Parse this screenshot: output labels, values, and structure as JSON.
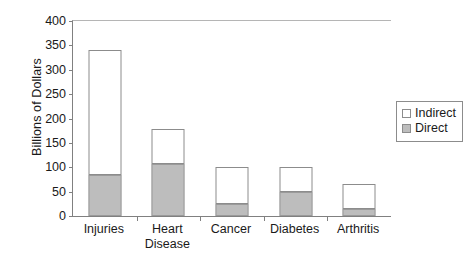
{
  "chart_data": {
    "type": "bar",
    "subtype": "stacked-vertical",
    "title": "",
    "xlabel": "",
    "ylabel": "Billions of Dollars",
    "ylim": [
      0,
      400
    ],
    "yticks": [
      0,
      50,
      100,
      150,
      200,
      250,
      300,
      350,
      400
    ],
    "ytick_labels": [
      "0",
      "50",
      "100",
      "150",
      "200",
      "250",
      "300",
      "350",
      "400"
    ],
    "grid": false,
    "legend_position": "right",
    "categories": [
      "Injuries",
      "Heart Disease",
      "Cancer",
      "Diabetes",
      "Arthritis"
    ],
    "category_label_lines": [
      [
        "Injuries"
      ],
      [
        "Heart",
        "Disease"
      ],
      [
        "Cancer"
      ],
      [
        "Diabetes"
      ],
      [
        "Arthritis"
      ]
    ],
    "series": [
      {
        "name": "Direct",
        "values": [
          85,
          107,
          25,
          50,
          15
        ],
        "color": "#bdbdbd"
      },
      {
        "name": "Indirect",
        "values": [
          255,
          71,
          75,
          50,
          50
        ],
        "color": "#ffffff"
      }
    ],
    "totals": [
      340,
      178,
      100,
      100,
      65
    ]
  },
  "legend": {
    "items": [
      {
        "label": "Indirect",
        "swatch": "white-square"
      },
      {
        "label": "Direct",
        "swatch": "gray-square"
      }
    ]
  },
  "colors": {
    "direct_fill": "#bdbdbd",
    "indirect_fill": "#ffffff",
    "bar_outline": "#8c8c8c",
    "axis": "#808080",
    "text": "#1a1a1a",
    "background": "#ffffff"
  }
}
